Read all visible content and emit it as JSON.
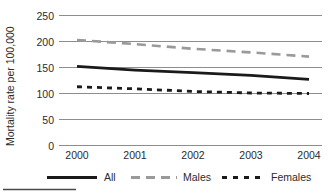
{
  "chart_data": {
    "type": "line",
    "title": "",
    "subtitle": "",
    "xlabel": "",
    "ylabel": "Mortality rate per 100,000",
    "x": [
      2000,
      2001,
      2002,
      2003,
      2004
    ],
    "xticklabels": [
      "2000",
      "2001",
      "2002",
      "2003",
      "2004"
    ],
    "xlim": [
      2000,
      2004
    ],
    "ylim": [
      0,
      250
    ],
    "yticks": [
      0,
      50,
      100,
      150,
      200,
      250
    ],
    "yticklabels": [
      "0",
      "50",
      "100",
      "150",
      "200",
      "250"
    ],
    "grid": "horizontal",
    "legend_position": "bottom",
    "series": [
      {
        "name": "All",
        "style": "solid",
        "color": "#1a1a1a",
        "width": 2.6,
        "values": [
          152,
          145,
          140,
          135,
          127
        ]
      },
      {
        "name": "Males",
        "style": "long-dash",
        "color": "#9a9a9a",
        "width": 2.6,
        "values": [
          203,
          195,
          186,
          179,
          171
        ]
      },
      {
        "name": "Females",
        "style": "short-dash",
        "color": "#1a1a1a",
        "width": 2.6,
        "values": [
          113,
          109,
          104,
          101,
          100
        ]
      }
    ]
  },
  "axes": {
    "y_title": "Mortality rate per 100,000",
    "y_ticks": [
      "250",
      "200",
      "150",
      "100",
      "50",
      "0"
    ],
    "x_ticks": [
      "2000",
      "2001",
      "2002",
      "2003",
      "2004"
    ]
  },
  "legend": {
    "items": [
      {
        "label": "All",
        "swatch": "solid-line-swatch"
      },
      {
        "label": "Males",
        "swatch": "long-dash-line-swatch"
      },
      {
        "label": "Females",
        "swatch": "short-dash-line-swatch"
      }
    ]
  },
  "footer": {
    "rule": ""
  },
  "colors": {
    "all_series": "#1a1a1a",
    "males_series": "#9a9a9a",
    "females_series": "#1a1a1a",
    "gridline": "#8d8d8d",
    "text": "#2b2b2b",
    "background": "#ffffff"
  }
}
